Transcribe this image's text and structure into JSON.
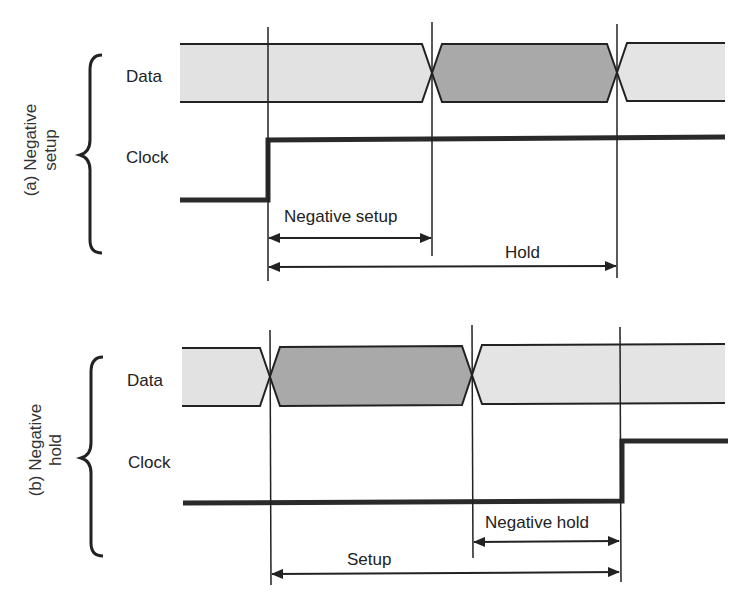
{
  "panels": [
    {
      "id": "a",
      "side_label_line1": "(a) Negative",
      "side_label_line2": "setup",
      "signals": [
        "Data",
        "Clock"
      ],
      "data_label": "Data",
      "clock_label": "Clock",
      "measurements": [
        {
          "label": "Negative setup",
          "from": "clock edge",
          "to": "data transition start",
          "direction": "both"
        },
        {
          "label": "Hold",
          "from": "clock edge",
          "to": "data transition end",
          "direction": "both"
        }
      ],
      "negative_setup_label": "Negative setup",
      "hold_label": "Hold"
    },
    {
      "id": "b",
      "side_label_line1": "(b) Negative",
      "side_label_line2": "hold",
      "signals": [
        "Data",
        "Clock"
      ],
      "data_label": "Data",
      "clock_label": "Clock",
      "measurements": [
        {
          "label": "Negative hold",
          "from": "data transition end",
          "to": "clock edge",
          "direction": "both"
        },
        {
          "label": "Setup",
          "from": "data transition start",
          "to": "clock edge",
          "direction": "both"
        }
      ],
      "negative_hold_label": "Negative hold",
      "setup_label": "Setup"
    }
  ],
  "colors": {
    "data_light": "#e2e2e2",
    "data_dark": "#a9a9a9",
    "line": "#222222",
    "clock": "#2a2a2a"
  }
}
